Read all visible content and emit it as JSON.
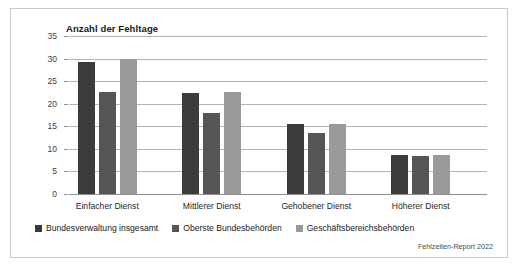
{
  "figure": {
    "source_note": "Fehlzeiten-Report 2022",
    "border_color": "#c9c9c9"
  },
  "chart_data": {
    "type": "bar",
    "title": "Anzahl der Fehltage",
    "xlabel": "",
    "ylabel": "Anzahl der Fehltage",
    "ylim": [
      0,
      35
    ],
    "yticks": [
      0,
      5,
      10,
      15,
      20,
      25,
      30,
      35
    ],
    "ytick_labels": [
      "0",
      "5",
      "10",
      "15",
      "20",
      "25",
      "30",
      "35"
    ],
    "grid": true,
    "legend_position": "bottom-left",
    "categories": [
      "Einfacher Dienst",
      "Mittlerer Dienst",
      "Gehobener Dienst",
      "Höherer Dienst"
    ],
    "series": [
      {
        "name": "Bundesverwaltung insgesamt",
        "color": "#3b3b3b",
        "values": [
          29.3,
          22.3,
          15.4,
          8.7
        ]
      },
      {
        "name": "Oberste Bundesbehörden",
        "color": "#555555",
        "values": [
          22.5,
          18.0,
          13.5,
          8.4
        ]
      },
      {
        "name": "Geschäftsbereichsbehörden",
        "color": "#9a9a9a",
        "values": [
          30.0,
          22.7,
          15.6,
          8.7
        ]
      }
    ]
  }
}
